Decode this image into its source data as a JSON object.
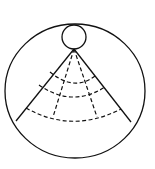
{
  "diagram": {
    "type": "fan-sector-in-circle",
    "stroke_color": "#111111",
    "background_color": "#ffffff",
    "outer_circle": {
      "cx": 75,
      "cy": 91,
      "rx": 70,
      "ry": 67
    },
    "small_circle": {
      "cx": 74,
      "cy": 37,
      "r": 12
    },
    "apex": {
      "x": 74,
      "y": 49
    },
    "solid_rays": [
      {
        "x": 16,
        "y": 121
      },
      {
        "x": 131,
        "y": 122
      }
    ],
    "dashed_rays": [
      {
        "x": 53,
        "y": 117
      },
      {
        "x": 97,
        "y": 117
      }
    ],
    "dashed_arcs": [
      {
        "x1": 50,
        "y1": 72,
        "cx": 74,
        "cy": 92,
        "x2": 95,
        "y2": 76
      },
      {
        "x1": 39,
        "y1": 85,
        "cx": 72,
        "cy": 108,
        "x2": 105,
        "y2": 87
      },
      {
        "x1": 26,
        "y1": 108,
        "cx": 72,
        "cy": 134,
        "x2": 121,
        "y2": 109
      }
    ]
  }
}
